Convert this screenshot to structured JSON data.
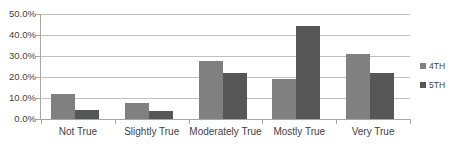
{
  "chart_data": {
    "type": "bar",
    "title": "",
    "subtitle": "",
    "xlabel": "",
    "ylabel": "",
    "categories": [
      "Not True",
      "Slightly True",
      "Moderately True",
      "Mostly True",
      "Very True"
    ],
    "series": [
      {
        "name": "4TH",
        "color": "#808080",
        "values": [
          12.0,
          7.5,
          27.5,
          19.0,
          31.0
        ]
      },
      {
        "name": "5TH",
        "color": "#565656",
        "values": [
          4.5,
          4.0,
          22.0,
          44.5,
          22.0
        ]
      }
    ],
    "ylim": [
      0,
      50
    ],
    "yticks": [
      0,
      10,
      20,
      30,
      40,
      50
    ],
    "ytick_labels": [
      "0.0%",
      "10.0%",
      "20.0%",
      "30.0%",
      "40.0%",
      "50.0%"
    ],
    "grid": true,
    "grid_axis": "y",
    "legend_position": "right",
    "legend": [
      "4TH",
      "5TH"
    ],
    "background": "#ffffff",
    "gridline_color": "#bfbfbf",
    "axis_color": "#a6a6a6"
  }
}
